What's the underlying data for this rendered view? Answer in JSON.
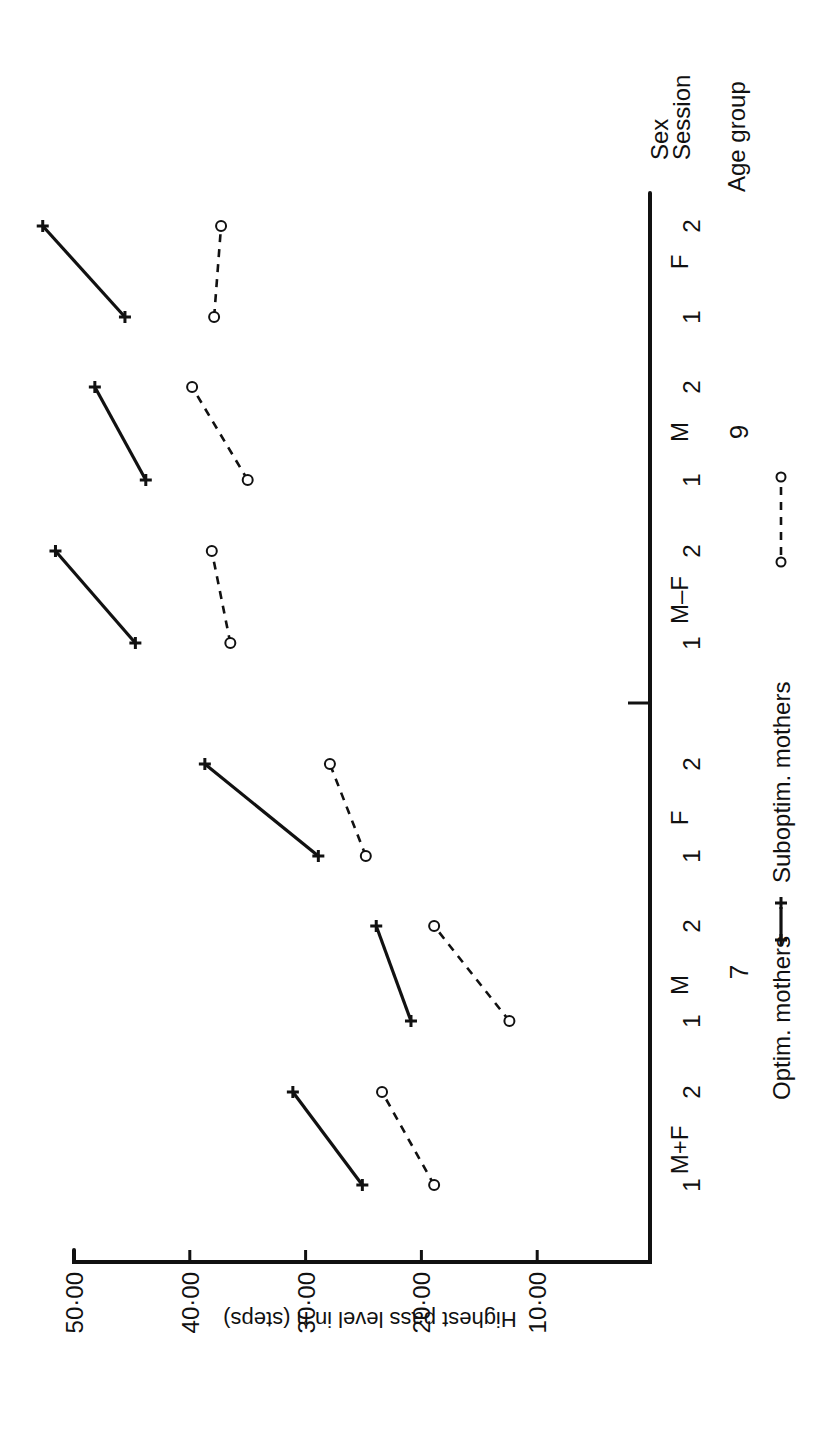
{
  "chart_data": {
    "type": "line",
    "orientation": "rotated-90-clockwise (value axis horizontal at bottom, category axis vertical at right)",
    "title": "",
    "ylabel": "Highest pass level in n (steps)",
    "xlabel_rows": [
      "Sex",
      "Session",
      "Age group"
    ],
    "ylim": [
      0,
      50
    ],
    "yticks": [
      10,
      20,
      30,
      40,
      50
    ],
    "ytick_labels": [
      "10·00",
      "20·00",
      "30·00",
      "40·00",
      "50·00"
    ],
    "grid": false,
    "legend": [
      {
        "name": "Optim. mothers",
        "style": "solid",
        "marker": "plus"
      },
      {
        "name": "Suboptim. mothers",
        "style": "dashed",
        "marker": "circle"
      }
    ],
    "legend_position": "right (below category axis labels)",
    "age_groups": [
      {
        "age": "7",
        "sex_groups": [
          {
            "sex": "M+F",
            "sessions": [
              "1",
              "2"
            ],
            "optim": [
              25.1,
              31.1
            ],
            "suboptim": [
              18.9,
              23.4
            ]
          },
          {
            "sex": "M",
            "sessions": [
              "1",
              "2"
            ],
            "optim": [
              20.9,
              23.9
            ],
            "suboptim": [
              12.4,
              18.9
            ]
          },
          {
            "sex": "F",
            "sessions": [
              "1",
              "2"
            ],
            "optim": [
              28.9,
              38.7
            ],
            "suboptim": [
              24.8,
              27.9
            ]
          }
        ]
      },
      {
        "age": "9",
        "sex_groups": [
          {
            "sex": "M–F",
            "sessions": [
              "1",
              "2"
            ],
            "optim": [
              44.7,
              51.6
            ],
            "suboptim": [
              36.5,
              38.1
            ]
          },
          {
            "sex": "M",
            "sessions": [
              "1",
              "2"
            ],
            "optim": [
              43.8,
              48.2
            ],
            "suboptim": [
              35.0,
              39.8
            ]
          },
          {
            "sex": "F",
            "sessions": [
              "1",
              "2"
            ],
            "optim": [
              45.6,
              52.7
            ],
            "suboptim": [
              37.9,
              37.3
            ]
          }
        ]
      }
    ],
    "categories": [
      "7 M+F 1",
      "7 M+F 2",
      "7 M 1",
      "7 M 2",
      "7 F 1",
      "7 F 2",
      "9 M–F 1",
      "9 M–F 2",
      "9 M 1",
      "9 M 2",
      "9 F 1",
      "9 F 2"
    ],
    "series": [
      {
        "name": "Optim. mothers",
        "values": [
          25.1,
          31.1,
          20.9,
          23.9,
          28.9,
          38.7,
          44.7,
          51.6,
          43.8,
          48.2,
          45.6,
          52.7
        ]
      },
      {
        "name": "Suboptim. mothers",
        "values": [
          18.9,
          23.4,
          12.4,
          18.9,
          24.8,
          27.9,
          36.5,
          38.1,
          35.0,
          39.8,
          37.9,
          37.3
        ]
      }
    ]
  },
  "labels": {
    "ylabel": "Highest pass level in n (steps)",
    "row_sex": "Sex",
    "row_session": "Session",
    "row_age": "Age group",
    "legend_optim": "Optim. mothers",
    "legend_suboptim": "Suboptim. mothers"
  }
}
